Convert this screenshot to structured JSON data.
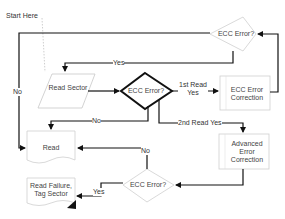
{
  "diagram": {
    "start_label": "Start Here",
    "nodes": {
      "read_sector": "Read Sector",
      "ecc_error_main": "ECC Error?",
      "ecc_error_top": "ECC Error?",
      "ecc_error_correction": "ECC Error Correction",
      "advanced_error_correction": "Advanced Error Correction",
      "ecc_error_bottom": "ECC Error?",
      "read": "Read",
      "read_failure": "Read Failure, Tag Sector"
    },
    "edges": {
      "no_left": "No",
      "yes_top": "Yes",
      "first_read_yes": "1st Read Yes",
      "no_main": "No",
      "second_read_yes": "2nd Read Yes",
      "no_bottom": "No",
      "yes_bottom": "Yes"
    },
    "colors": {
      "line": "#111111",
      "shape_border": "#bbbbbb",
      "main_diamond_border": "#111111"
    }
  }
}
